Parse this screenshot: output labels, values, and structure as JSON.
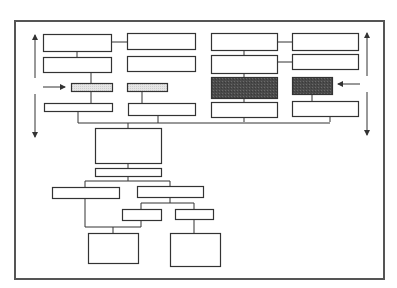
{
  "diagram": {
    "type": "block-flowchart",
    "labels": [],
    "colors": {
      "background": "#ffffff",
      "stroke": "#333333",
      "frame": "#555555",
      "dark_fill": "#4a4a4a",
      "light_fill": "#e2e2e2"
    },
    "frame": {
      "x": 15,
      "y": 21,
      "w": 369,
      "h": 258
    },
    "boxes": [
      {
        "id": "L1",
        "x": 43,
        "y": 34,
        "w": 68,
        "h": 17,
        "fill": "none"
      },
      {
        "id": "L2",
        "x": 43,
        "y": 57,
        "w": 68,
        "h": 15,
        "fill": "none"
      },
      {
        "id": "L3",
        "x": 71,
        "y": 83,
        "w": 41,
        "h": 8,
        "fill": "light"
      },
      {
        "id": "L4",
        "x": 44,
        "y": 103,
        "w": 68,
        "h": 8,
        "fill": "none"
      },
      {
        "id": "M1",
        "x": 127,
        "y": 33,
        "w": 68,
        "h": 16,
        "fill": "none"
      },
      {
        "id": "M2",
        "x": 127,
        "y": 56,
        "w": 68,
        "h": 15,
        "fill": "none"
      },
      {
        "id": "M3",
        "x": 127,
        "y": 83,
        "w": 40,
        "h": 8,
        "fill": "light"
      },
      {
        "id": "M4",
        "x": 128,
        "y": 103,
        "w": 67,
        "h": 12,
        "fill": "none"
      },
      {
        "id": "R1",
        "x": 211,
        "y": 33,
        "w": 66,
        "h": 17,
        "fill": "none"
      },
      {
        "id": "R2",
        "x": 211,
        "y": 55,
        "w": 66,
        "h": 18,
        "fill": "none"
      },
      {
        "id": "R3",
        "x": 211,
        "y": 77,
        "w": 66,
        "h": 21,
        "fill": "dark"
      },
      {
        "id": "R4",
        "x": 211,
        "y": 102,
        "w": 66,
        "h": 15,
        "fill": "none"
      },
      {
        "id": "S1",
        "x": 292,
        "y": 33,
        "w": 66,
        "h": 17,
        "fill": "none"
      },
      {
        "id": "S2",
        "x": 292,
        "y": 54,
        "w": 66,
        "h": 15,
        "fill": "none"
      },
      {
        "id": "S3",
        "x": 292,
        "y": 77,
        "w": 40,
        "h": 17,
        "fill": "dark"
      },
      {
        "id": "S4",
        "x": 292,
        "y": 101,
        "w": 66,
        "h": 15,
        "fill": "none"
      },
      {
        "id": "C1",
        "x": 95,
        "y": 128,
        "w": 66,
        "h": 35,
        "fill": "none"
      },
      {
        "id": "C2",
        "x": 95,
        "y": 168,
        "w": 66,
        "h": 8,
        "fill": "none"
      },
      {
        "id": "D1",
        "x": 52,
        "y": 187,
        "w": 67,
        "h": 11,
        "fill": "none"
      },
      {
        "id": "D2",
        "x": 137,
        "y": 186,
        "w": 66,
        "h": 11,
        "fill": "none"
      },
      {
        "id": "E1",
        "x": 122,
        "y": 209,
        "w": 39,
        "h": 11,
        "fill": "none"
      },
      {
        "id": "E2",
        "x": 175,
        "y": 209,
        "w": 38,
        "h": 10,
        "fill": "none"
      },
      {
        "id": "F1",
        "x": 88,
        "y": 233,
        "w": 50,
        "h": 30,
        "fill": "none"
      },
      {
        "id": "F2",
        "x": 170,
        "y": 233,
        "w": 50,
        "h": 33,
        "fill": "none"
      }
    ],
    "lines": [
      [
        111,
        42,
        127,
        42
      ],
      [
        77,
        51,
        77,
        57
      ],
      [
        91,
        72,
        91,
        83
      ],
      [
        91,
        91,
        91,
        103
      ],
      [
        142,
        91,
        142,
        103
      ],
      [
        78,
        111,
        78,
        123
      ],
      [
        158,
        115,
        158,
        123
      ],
      [
        244,
        50,
        244,
        55
      ],
      [
        277,
        42,
        292,
        42
      ],
      [
        277,
        62,
        292,
        62
      ],
      [
        244,
        73,
        244,
        77
      ],
      [
        244,
        98,
        244,
        102
      ],
      [
        312,
        94,
        312,
        101
      ],
      [
        244,
        117,
        244,
        122
      ],
      [
        330,
        116,
        330,
        122
      ],
      [
        0,
        123,
        330,
        123
      ],
      [
        128,
        123,
        128,
        128
      ],
      [
        128,
        163,
        128,
        168
      ],
      [
        128,
        176,
        128,
        181
      ],
      [
        85,
        181,
        170,
        181
      ],
      [
        85,
        181,
        85,
        187
      ],
      [
        170,
        181,
        170,
        186
      ],
      [
        85,
        198,
        85,
        227
      ],
      [
        170,
        197,
        170,
        203
      ],
      [
        141,
        203,
        194,
        203
      ],
      [
        141,
        203,
        141,
        209
      ],
      [
        194,
        203,
        194,
        209
      ],
      [
        85,
        227,
        141,
        227
      ],
      [
        141,
        220,
        141,
        227
      ],
      [
        113,
        227,
        113,
        233
      ],
      [
        194,
        219,
        194,
        233
      ]
    ],
    "arrows": [
      {
        "id": "left-vertical-up",
        "x1": 35,
        "y1": 78,
        "x2": 35,
        "y2": 35,
        "head": "end"
      },
      {
        "id": "left-vertical-down",
        "x1": 35,
        "y1": 94,
        "x2": 35,
        "y2": 137,
        "head": "end"
      },
      {
        "id": "left-horizontal",
        "x1": 43,
        "y1": 87,
        "x2": 65,
        "y2": 87,
        "head": "end"
      },
      {
        "id": "right-vertical-up",
        "x1": 367,
        "y1": 76,
        "x2": 367,
        "y2": 33,
        "head": "end"
      },
      {
        "id": "right-vertical-down",
        "x1": 367,
        "y1": 92,
        "x2": 367,
        "y2": 135,
        "head": "end"
      },
      {
        "id": "right-horizontal",
        "x1": 360,
        "y1": 84,
        "x2": 338,
        "y2": 84,
        "head": "end"
      }
    ]
  }
}
